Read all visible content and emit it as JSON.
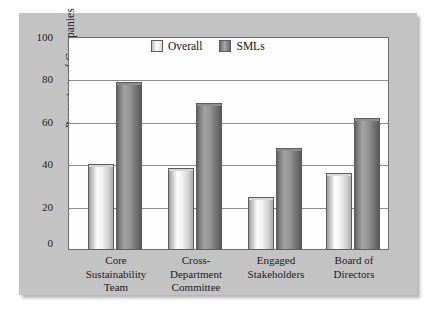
{
  "chart_data": {
    "type": "bar",
    "title": "",
    "subtitle": "",
    "xlabel": "",
    "ylabel": "Percentage of Companies",
    "ylim": [
      0,
      100
    ],
    "yticks": [
      0,
      20,
      40,
      60,
      80,
      100
    ],
    "ytick_labels": [
      "0",
      "20",
      "40",
      "60",
      "80",
      "100"
    ],
    "grid": true,
    "grid_orientation": "horizontal",
    "legend_position": "top-center-inside",
    "categories": [
      "Core Sustainability Team",
      "Cross-Department Committee",
      "Engaged Stakeholders",
      "Board of Directors"
    ],
    "category_label_lines": [
      [
        "Core",
        "Sustainability",
        "Team"
      ],
      [
        "Cross-",
        "Department",
        "Committee"
      ],
      [
        "Engaged",
        "Stakeholders"
      ],
      [
        "Board of",
        "Directors"
      ]
    ],
    "series": [
      {
        "name": "Overall",
        "color": "#e8e8e8",
        "values": [
          40.5,
          38.5,
          25,
          36
        ]
      },
      {
        "name": "SMLs",
        "color": "#8a8a8a",
        "values": [
          79,
          69,
          48,
          62
        ]
      }
    ]
  },
  "legend": {
    "entries": [
      {
        "label": "Overall"
      },
      {
        "label": "SMLs"
      }
    ]
  },
  "colors": {
    "panel_background": "#c3c3c3",
    "plot_background": "#fdfdfd",
    "axis": "#6e6e6e",
    "gridline": "#8d8d8d",
    "text": "#1b1b1b",
    "series_overall": "#e8e8e8",
    "series_smls": "#8a8a8a"
  }
}
